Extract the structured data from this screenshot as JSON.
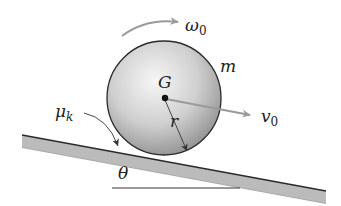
{
  "figure": {
    "labels": {
      "omega": "ω",
      "omega_sub": "0",
      "mass": "m",
      "center": "G",
      "velocity": "v",
      "velocity_sub": "0",
      "friction": "μ",
      "friction_sub": "k",
      "radius": "r",
      "angle": "θ"
    },
    "colors": {
      "outline": "#2a2a2a",
      "arrow_gray": "#9a9a9a",
      "sphere_light": "#f4f4f4",
      "sphere_dark": "#9c9c9c",
      "ground_shade": "#b5b5b5"
    }
  }
}
